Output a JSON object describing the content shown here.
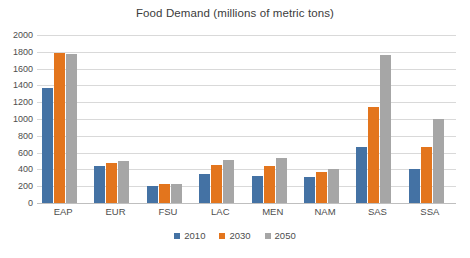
{
  "chart_data": {
    "type": "bar",
    "title": "Food Demand (millions of metric tons)",
    "xlabel": "",
    "ylabel": "",
    "ylim": [
      0,
      2000
    ],
    "ytick_step": 200,
    "yticks": [
      2000,
      1800,
      1600,
      1400,
      1200,
      1000,
      800,
      600,
      400,
      200,
      0
    ],
    "grid": true,
    "legend_position": "bottom",
    "categories": [
      "EAP",
      "EUR",
      "FSU",
      "LAC",
      "MEN",
      "NAM",
      "SAS",
      "SSA"
    ],
    "series": [
      {
        "name": "2010",
        "color": "#4472a4",
        "values": [
          1375,
          440,
          205,
          350,
          320,
          305,
          670,
          400
        ]
      },
      {
        "name": "2030",
        "color": "#e3751d",
        "values": [
          1790,
          475,
          225,
          450,
          440,
          370,
          1145,
          670
        ]
      },
      {
        "name": "2050",
        "color": "#a6a6a6",
        "values": [
          1770,
          495,
          230,
          510,
          530,
          410,
          1765,
          1005
        ]
      }
    ]
  },
  "colors": {
    "background": "#ffffff",
    "gridline": "#d9d9d9",
    "axis": "#bfbfbf",
    "text": "#4d4d4d",
    "title_text": "#3b3b3b"
  }
}
